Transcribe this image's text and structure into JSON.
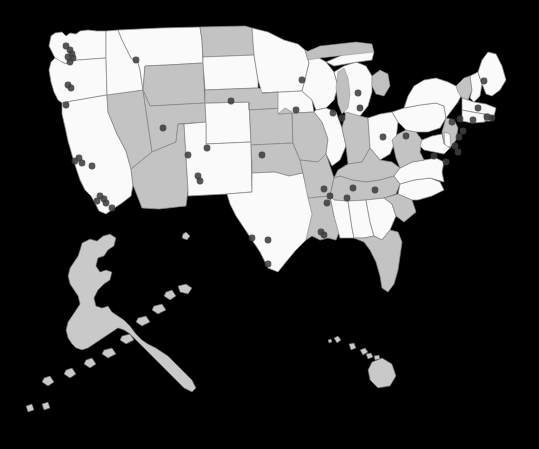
{
  "figure": {
    "type": "map",
    "title": "",
    "subtitle": "",
    "projection": "albers-usa",
    "background_color": "#c9c9c9",
    "width": 539,
    "height": 449
  },
  "legend": {
    "visible": false,
    "entries": []
  },
  "style": {
    "state_fill_light": "#fafafa",
    "state_fill_dark": "#c3c3c3",
    "state_border_color": "#8a8a8a",
    "outline_only_fill": "#c9c9c9",
    "outline_only_stroke": "#5a5a5a",
    "marker_color": "#3d3d3d",
    "marker_opacity": 0.88,
    "marker_radius": 3.4,
    "lake_fill": "#c0c0c0"
  },
  "regions": {
    "contiguous_count": 48,
    "outline_only": [
      "Alaska",
      "Hawaii"
    ],
    "shading_note": "States alternate between light and dark fill; shading is categorical, not value-encoded"
  },
  "state_shading": [
    {
      "name": "Washington",
      "fill": "light"
    },
    {
      "name": "Oregon",
      "fill": "light"
    },
    {
      "name": "California",
      "fill": "light"
    },
    {
      "name": "Nevada",
      "fill": "dark"
    },
    {
      "name": "Idaho",
      "fill": "light"
    },
    {
      "name": "Montana",
      "fill": "light"
    },
    {
      "name": "Wyoming",
      "fill": "dark"
    },
    {
      "name": "Utah",
      "fill": "dark"
    },
    {
      "name": "Arizona",
      "fill": "dark"
    },
    {
      "name": "Colorado",
      "fill": "light"
    },
    {
      "name": "New Mexico",
      "fill": "light"
    },
    {
      "name": "North Dakota",
      "fill": "dark"
    },
    {
      "name": "South Dakota",
      "fill": "light"
    },
    {
      "name": "Nebraska",
      "fill": "dark"
    },
    {
      "name": "Kansas",
      "fill": "dark"
    },
    {
      "name": "Oklahoma",
      "fill": "dark"
    },
    {
      "name": "Texas",
      "fill": "light"
    },
    {
      "name": "Minnesota",
      "fill": "light"
    },
    {
      "name": "Iowa",
      "fill": "light"
    },
    {
      "name": "Missouri",
      "fill": "dark"
    },
    {
      "name": "Arkansas",
      "fill": "dark"
    },
    {
      "name": "Louisiana",
      "fill": "dark"
    },
    {
      "name": "Wisconsin",
      "fill": "light"
    },
    {
      "name": "Illinois",
      "fill": "light"
    },
    {
      "name": "Michigan",
      "fill": "light"
    },
    {
      "name": "Indiana",
      "fill": "dark"
    },
    {
      "name": "Ohio",
      "fill": "light"
    },
    {
      "name": "Kentucky",
      "fill": "dark"
    },
    {
      "name": "Tennessee",
      "fill": "dark"
    },
    {
      "name": "Mississippi",
      "fill": "light"
    },
    {
      "name": "Alabama",
      "fill": "light"
    },
    {
      "name": "Georgia",
      "fill": "light"
    },
    {
      "name": "Florida",
      "fill": "dark"
    },
    {
      "name": "South Carolina",
      "fill": "dark"
    },
    {
      "name": "North Carolina",
      "fill": "light"
    },
    {
      "name": "Virginia",
      "fill": "light"
    },
    {
      "name": "West Virginia",
      "fill": "dark"
    },
    {
      "name": "Pennsylvania",
      "fill": "light"
    },
    {
      "name": "New York",
      "fill": "light"
    },
    {
      "name": "Vermont",
      "fill": "dark"
    },
    {
      "name": "New Hampshire",
      "fill": "light"
    },
    {
      "name": "Maine",
      "fill": "light"
    },
    {
      "name": "Massachusetts",
      "fill": "light"
    },
    {
      "name": "Rhode Island",
      "fill": "dark"
    },
    {
      "name": "Connecticut",
      "fill": "light"
    },
    {
      "name": "New Jersey",
      "fill": "dark"
    },
    {
      "name": "Delaware",
      "fill": "light"
    },
    {
      "name": "Maryland",
      "fill": "light"
    }
  ],
  "chart_data": {
    "type": "scatter",
    "title": "",
    "xlabel": "",
    "ylabel": "",
    "points": [
      {
        "x": 66,
        "y": 46
      },
      {
        "x": 70,
        "y": 50
      },
      {
        "x": 72,
        "y": 54
      },
      {
        "x": 68,
        "y": 57
      },
      {
        "x": 73,
        "y": 58
      },
      {
        "x": 70,
        "y": 62
      },
      {
        "x": 68,
        "y": 85
      },
      {
        "x": 71,
        "y": 88
      },
      {
        "x": 66,
        "y": 105
      },
      {
        "x": 136,
        "y": 60
      },
      {
        "x": 163,
        "y": 128
      },
      {
        "x": 79,
        "y": 158
      },
      {
        "x": 75,
        "y": 161
      },
      {
        "x": 82,
        "y": 163
      },
      {
        "x": 92,
        "y": 166
      },
      {
        "x": 100,
        "y": 196
      },
      {
        "x": 104,
        "y": 199
      },
      {
        "x": 97,
        "y": 201
      },
      {
        "x": 106,
        "y": 203
      },
      {
        "x": 112,
        "y": 208
      },
      {
        "x": 188,
        "y": 155
      },
      {
        "x": 198,
        "y": 176
      },
      {
        "x": 200,
        "y": 181
      },
      {
        "x": 207,
        "y": 148
      },
      {
        "x": 231,
        "y": 101
      },
      {
        "x": 262,
        "y": 155
      },
      {
        "x": 268,
        "y": 240
      },
      {
        "x": 268,
        "y": 264
      },
      {
        "x": 252,
        "y": 238
      },
      {
        "x": 302,
        "y": 80
      },
      {
        "x": 296,
        "y": 110
      },
      {
        "x": 333,
        "y": 113
      },
      {
        "x": 342,
        "y": 118
      },
      {
        "x": 358,
        "y": 93
      },
      {
        "x": 360,
        "y": 108
      },
      {
        "x": 383,
        "y": 137
      },
      {
        "x": 324,
        "y": 189
      },
      {
        "x": 330,
        "y": 196
      },
      {
        "x": 327,
        "y": 203
      },
      {
        "x": 321,
        "y": 232
      },
      {
        "x": 324,
        "y": 235
      },
      {
        "x": 347,
        "y": 198
      },
      {
        "x": 353,
        "y": 188
      },
      {
        "x": 375,
        "y": 190
      },
      {
        "x": 406,
        "y": 136
      },
      {
        "x": 459,
        "y": 137
      },
      {
        "x": 463,
        "y": 131
      },
      {
        "x": 455,
        "y": 146
      },
      {
        "x": 458,
        "y": 152
      },
      {
        "x": 452,
        "y": 122
      },
      {
        "x": 460,
        "y": 119
      },
      {
        "x": 473,
        "y": 120
      },
      {
        "x": 478,
        "y": 108
      },
      {
        "x": 487,
        "y": 117
      },
      {
        "x": 492,
        "y": 118
      },
      {
        "x": 484,
        "y": 81
      },
      {
        "x": 446,
        "y": 162
      },
      {
        "x": 434,
        "y": 156
      }
    ],
    "point_count": 58,
    "grid": false,
    "legend_position": "none"
  }
}
